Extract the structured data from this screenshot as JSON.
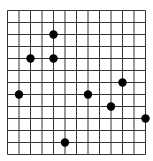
{
  "grid": {
    "cols": 12,
    "rows": 12,
    "origin_x": 7.5,
    "origin_y": 10.5,
    "cell_w": 11.5,
    "cell_h": 12,
    "line_color": "#333333",
    "dot_color": "#000000",
    "dot_radius": 4.2
  },
  "points": [
    {
      "col": 4,
      "row": 2
    },
    {
      "col": 2,
      "row": 4
    },
    {
      "col": 4,
      "row": 4
    },
    {
      "col": 10,
      "row": 6
    },
    {
      "col": 1,
      "row": 7
    },
    {
      "col": 7,
      "row": 7
    },
    {
      "col": 9,
      "row": 8
    },
    {
      "col": 12,
      "row": 9
    },
    {
      "col": 5,
      "row": 11
    }
  ]
}
